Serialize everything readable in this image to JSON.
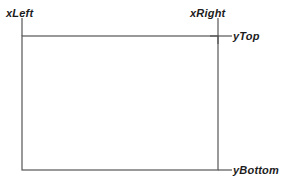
{
  "diagram": {
    "background_color": "#ffffff",
    "stroke_color": "#555555",
    "text_color": "#1c1c1c",
    "stroke_width": 1.2,
    "rect": {
      "x_left": 22,
      "x_right": 218,
      "y_top": 36,
      "y_bottom": 170,
      "width": 196,
      "height": 134,
      "fill": "#ffffff"
    },
    "ticks": [
      {
        "name": "tick-xleft",
        "orientation": "vertical",
        "x1": 22,
        "y1": 18,
        "x2": 22,
        "y2": 36
      },
      {
        "name": "tick-xright",
        "orientation": "vertical",
        "x1": 218,
        "y1": 18,
        "x2": 218,
        "y2": 44
      },
      {
        "name": "tick-ytop",
        "orientation": "horizontal",
        "x1": 210,
        "y1": 36,
        "x2": 232,
        "y2": 36
      },
      {
        "name": "tick-ybottom",
        "orientation": "horizontal",
        "x1": 218,
        "y1": 170,
        "x2": 232,
        "y2": 170
      }
    ],
    "labels": {
      "x_left": "xLeft",
      "x_right": "xRight",
      "y_top": "yTop",
      "y_bottom": "yBottom"
    }
  }
}
